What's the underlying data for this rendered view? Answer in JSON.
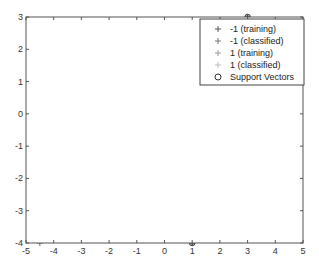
{
  "chart_data": {
    "type": "scatter",
    "title": "",
    "xlabel": "",
    "ylabel": "",
    "xlim": [
      -5,
      5
    ],
    "ylim": [
      -4,
      3
    ],
    "xticks": [
      -5,
      -4,
      -3,
      -2,
      -1,
      0,
      1,
      2,
      3,
      4,
      5
    ],
    "yticks": [
      3,
      2,
      1,
      0,
      -1,
      -2,
      -3,
      -4
    ],
    "grid": false,
    "legend_position": "upper right",
    "legend": [
      {
        "label": "-1 (training)",
        "marker": "+",
        "color": "#555555"
      },
      {
        "label": "-1 (classified)",
        "marker": "+",
        "color": "#777777"
      },
      {
        "label": "1 (training)",
        "marker": "+",
        "color": "#999999"
      },
      {
        "label": "1 (classified)",
        "marker": "+",
        "color": "#bbbbbb"
      },
      {
        "label": "Support Vectors",
        "marker": "o",
        "color": "#333333"
      }
    ],
    "series": [
      {
        "name": "-1 (training)",
        "points": [
          [
            -2,
            2
          ],
          [
            -3,
            0
          ],
          [
            -2,
            -1
          ],
          [
            -3,
            -2
          ],
          [
            -2,
            1
          ],
          [
            -1,
            -2
          ],
          [
            -3,
            -3
          ],
          [
            -4.5,
            -4
          ]
        ]
      },
      {
        "name": "1 (training)",
        "points": [
          [
            0,
            2
          ],
          [
            0,
            1
          ],
          [
            -1,
            0
          ],
          [
            -2,
            -3
          ],
          [
            2,
            0
          ],
          [
            2,
            -1
          ],
          [
            1,
            -2
          ],
          [
            1,
            -4
          ],
          [
            3,
            3
          ],
          [
            4,
            0
          ],
          [
            4,
            -2
          ],
          [
            3,
            -3
          ],
          [
            3,
            -1
          ],
          [
            2,
            -3
          ]
        ]
      },
      {
        "name": "Support Vectors",
        "points": [
          [
            -2,
            1
          ],
          [
            -1,
            -2
          ],
          [
            -3,
            -3
          ],
          [
            3,
            -1
          ],
          [
            2,
            -3
          ]
        ]
      }
    ],
    "small_circle_points": [
      [
        0,
        2
      ],
      [
        0,
        1
      ],
      [
        -1,
        0
      ],
      [
        -2,
        -3
      ],
      [
        2,
        0
      ],
      [
        2,
        -1
      ],
      [
        1,
        -2
      ],
      [
        1,
        -4
      ],
      [
        3,
        3
      ]
    ],
    "plus_only_points": [
      [
        -2,
        2
      ],
      [
        -3,
        0
      ],
      [
        -2,
        -1
      ],
      [
        -3,
        -2
      ],
      [
        4,
        0
      ],
      [
        4,
        -2
      ],
      [
        3,
        -3
      ],
      [
        -4.5,
        -4
      ]
    ],
    "decision_boundary": {
      "x": [
        -0.75,
        1.3
      ],
      "y": [
        -4,
        3
      ]
    }
  }
}
